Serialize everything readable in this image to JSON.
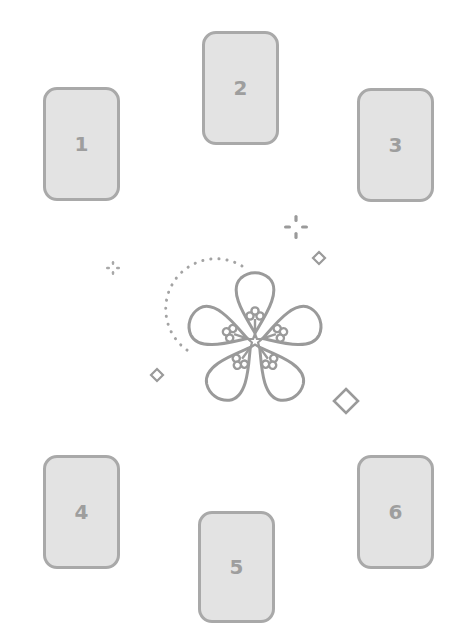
{
  "diagram": {
    "title": "",
    "colors": {
      "card_fill": "#e3e3e3",
      "card_border": "#a9a9a9",
      "number": "#9e9e9e",
      "ornament": "#9a9a9a",
      "background": "#ffffff"
    },
    "cards": [
      {
        "label": "1",
        "position": "upper-left"
      },
      {
        "label": "2",
        "position": "top-center"
      },
      {
        "label": "3",
        "position": "upper-right"
      },
      {
        "label": "4",
        "position": "lower-left"
      },
      {
        "label": "5",
        "position": "bottom-center"
      },
      {
        "label": "6",
        "position": "lower-right"
      }
    ],
    "center_ornament": {
      "icon": "plum-blossom-icon",
      "petals": 5,
      "accents": [
        "dotted-arc",
        "sparkle-large",
        "sparkle-small",
        "diamond-small-left",
        "diamond-small-right",
        "diamond-large"
      ]
    }
  }
}
